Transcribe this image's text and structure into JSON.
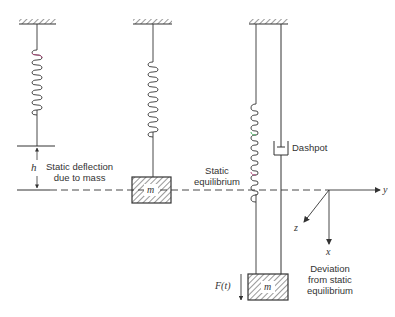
{
  "figure": {
    "left_system": {
      "deflection_symbol": "h",
      "deflection_label_line1": "Static deflection",
      "deflection_label_line2": "due to mass"
    },
    "middle_system": {
      "mass_label": "m",
      "equilibrium_label_line1": "Static",
      "equilibrium_label_line2": "equilibrium"
    },
    "right_system": {
      "damper_label": "Dashpot",
      "mass_label": "m",
      "force_label": "F(t)"
    },
    "axes": {
      "y_label": "y",
      "z_label": "z",
      "x_label": "x",
      "caption_line1": "Deviation",
      "caption_line2": "from static",
      "caption_line3": "equilibrium"
    },
    "colors": {
      "ink": "#333333",
      "coil_accent_pink": "#b0457a",
      "coil_accent_green": "#3fae5a"
    }
  }
}
